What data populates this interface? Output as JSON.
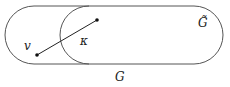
{
  "diagram": {
    "labels": {
      "outer_set": "G",
      "inner_set": "G̃",
      "vertex": "v",
      "node": "κ"
    },
    "colors": {
      "stroke": "#555555",
      "point": "#111111",
      "background": "#ffffff"
    },
    "elements": [
      {
        "type": "region",
        "name": "G",
        "shape": "stadium"
      },
      {
        "type": "region",
        "name": "G̃",
        "shape": "stadium",
        "inside": "G",
        "right_aligned": true
      },
      {
        "type": "point",
        "name": "v",
        "in": "G \\ G̃"
      },
      {
        "type": "point",
        "name": "κ-endpoint",
        "in": "G̃"
      },
      {
        "type": "segment",
        "from": "v",
        "to": "κ-endpoint"
      }
    ]
  }
}
